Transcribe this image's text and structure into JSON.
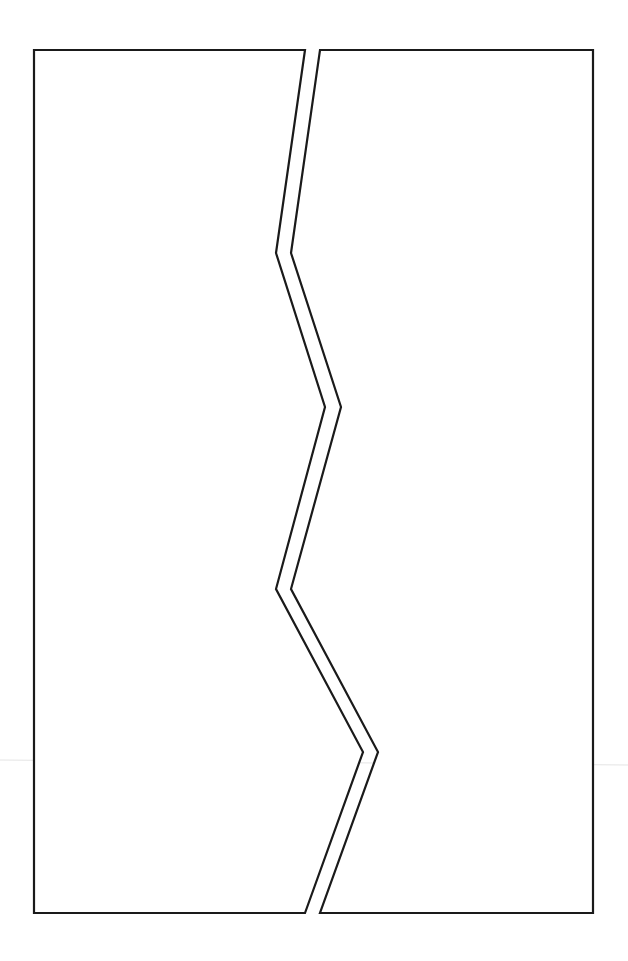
{
  "page": {
    "width": 628,
    "height": 961,
    "background": "#ffffff"
  },
  "layout": {
    "type": "comic-page",
    "panel_count": 2,
    "gutter": "zig-zag vertical split",
    "border_color": "#1a1a1a"
  },
  "panels": [
    {
      "id": "left-panel",
      "content": "",
      "points": "34,50 305,50 276,253 325,407 276,589 363,752 305,913 34,913"
    },
    {
      "id": "right-panel",
      "content": "",
      "points": "320,50 593,50 593,913 320,913 378,752 291,589 341,407 291,253"
    }
  ],
  "artifacts": {
    "scan_line": {
      "x1": 0,
      "y1": 760,
      "x2": 628,
      "y2": 765,
      "color": "#e4e4e4"
    }
  }
}
